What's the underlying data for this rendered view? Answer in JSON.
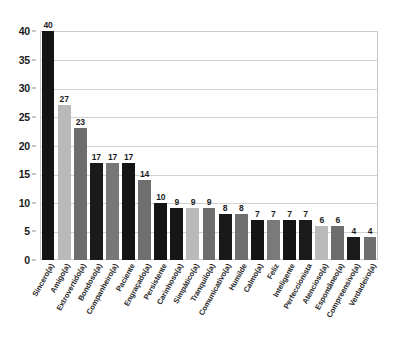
{
  "chart_data": {
    "type": "bar",
    "title": "",
    "subtitle": "",
    "xlabel": "",
    "ylabel": "",
    "ylim": [
      0,
      40
    ],
    "ytick_step": 5,
    "yticks": [
      0,
      5,
      10,
      15,
      20,
      25,
      30,
      35,
      40
    ],
    "grid": true,
    "legend": "none",
    "categories": [
      "Sincero(a)",
      "Amigo(a)",
      "Extrovertido(a)",
      "Bondoso(a)",
      "Companheiro(a)",
      "Paciente",
      "Engraçado(a)",
      "Persistente",
      "Carinhoso(a)",
      "Simpático(a)",
      "Tranquilo(a)",
      "Comunicativo(a)",
      "Humilde",
      "Calmo(a)",
      "Feliz",
      "Inteligente",
      "Perfeccionista",
      "Atencioso(a)",
      "Espontâneo(a)",
      "Compreensivo(a)",
      "Verdadeiro(a)"
    ],
    "values": [
      40,
      27,
      23,
      17,
      17,
      17,
      14,
      10,
      9,
      9,
      9,
      8,
      8,
      7,
      7,
      7,
      7,
      6,
      6,
      4,
      4
    ],
    "bar_colors": [
      "#141414",
      "#b9b9b9",
      "#6d6d6d",
      "#1a1a1a",
      "#777777",
      "#141414",
      "#6f6f6f",
      "#141414",
      "#161616",
      "#b9b9b9",
      "#6d6d6d",
      "#191919",
      "#6f6f6f",
      "#141414",
      "#7a7a7a",
      "#141414",
      "#1a1a1a",
      "#b9b9b9",
      "#6d6d6d",
      "#1a1a1a",
      "#6f6f6f"
    ]
  },
  "axis": {
    "y_tick_labels": [
      "0",
      "5",
      "10",
      "15",
      "20",
      "25",
      "30",
      "35",
      "40"
    ]
  },
  "style": {
    "grid_color": "#d2d2d2",
    "frame_color": "#c9c9c9",
    "text_color": "#1b1b1b",
    "background": "#ffffff"
  }
}
